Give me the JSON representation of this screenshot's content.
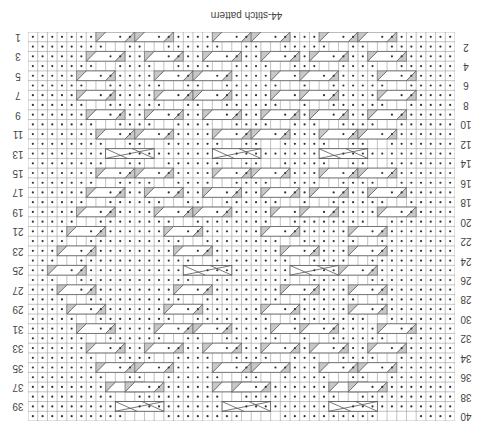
{
  "title": "44-stitch pattern",
  "grid": {
    "columns": 44,
    "rows": 40,
    "orientation": "rotated-180",
    "colors": {
      "line": "#9a9a9a",
      "dot": "#333333",
      "cable_fill": "#c8c8c8",
      "cable_line": "#555555"
    }
  },
  "row_labels_left": [
    "1",
    "3",
    "5",
    "7",
    "9",
    "11",
    "13",
    "15",
    "17",
    "19",
    "21",
    "23",
    "25",
    "27",
    "29",
    "31",
    "33",
    "35",
    "37",
    "39"
  ],
  "row_labels_right": [
    "2",
    "4",
    "6",
    "8",
    "10",
    "12",
    "14",
    "16",
    "18",
    "20",
    "22",
    "24",
    "26",
    "28",
    "30",
    "32",
    "34",
    "36",
    "38",
    "40"
  ],
  "rows": [
    "........C...C.......C...C......C...C.......",
    "........  ..  ......  ..  .....  ..  ......",
    ".......C.....C.....C.....C....C.....C......",
    ".......  ....  ....  ....  ...  ....  .....",
    "......C.......C...C.......C..C.......C.....",
    "......  ......  ..  ......  .  ......  ....",
    "......C.......C...C.......C..C.......C.....",
    "......  ......  ..  ......  .  ......  ....",
    ".......C.....C.....C.....C....C.....C......",
    ".......  ....  ....  ....  ...  ....  .....",
    "........C...C.......C...C......C...C.......",
    "........  ..  ......  ..  .....  ..  ......",
    ".........X..........X..........X...........",
    "........  ..  ......  ..  .....  ..  ......",
    "........C...C.......C...C......C...C.......",
    ".......  ....  ....  ....  ...  ....  .....",
    ".......C.....C.....C.....C....C.....C......",
    "......  ......  ..  ......  .  ......  ....",
    "......C.......C...C.......C..C.......C.....",
    ".....  ........  ........  ........  .....",
    ".....C.........C.........C........C.......",
    "....  ..........  ........  ......  ......",
    "....C...........C..........C......C.......",
    "...  ............  ........  ....  .......",
    "...C.............X..........X....C........",
    "...  ............  ........  ....  .......",
    "....C...........C..........C......C.......",
    "....  ..........  ........  ......  ......",
    ".....C.........C.........C........C.......",
    ".....  ........  ........  ........  .....",
    "......C.......C...C.......C..C.......C.....",
    "......  ......  ..  ......  .  ......  ....",
    ".......C.....C.....C.....C....C.....C......",
    ".......  ....  ....  ....  ...  ....  .....",
    "........C...C.......C...C......C...C.......",
    "........  ..  ......  ..  .....  ..  ......",
    ".........C.C........C.C.........C.C........",
    ".........  .........  ..........  .........",
    "..........X..........X..........X..........",
    "..........    ........    ..........    ...."
  ]
}
